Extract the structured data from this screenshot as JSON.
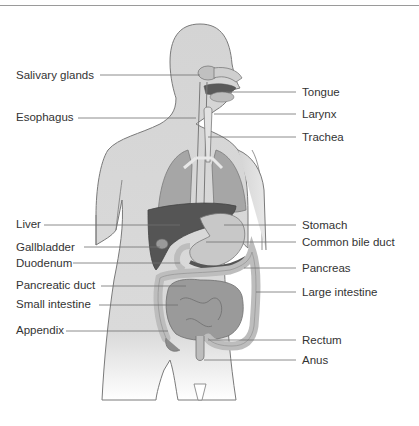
{
  "header": {
    "partial_text": "gest  y"
  },
  "diagram": {
    "labels_left": [
      {
        "id": "salivary-glands",
        "text": "Salivary glands",
        "x": 16,
        "y": 69
      },
      {
        "id": "esophagus",
        "text": "Esophagus",
        "x": 16,
        "y": 111
      },
      {
        "id": "liver",
        "text": "Liver",
        "x": 16,
        "y": 218
      },
      {
        "id": "gallbladder",
        "text": "Gallbladder",
        "x": 16,
        "y": 241
      },
      {
        "id": "duodenum",
        "text": "Duodenum",
        "x": 16,
        "y": 257
      },
      {
        "id": "pancreatic-duct",
        "text": "Pancreatic duct",
        "x": 16,
        "y": 279
      },
      {
        "id": "small-intestine",
        "text": "Small intestine",
        "x": 16,
        "y": 298
      },
      {
        "id": "appendix",
        "text": "Appendix",
        "x": 16,
        "y": 324
      }
    ],
    "labels_right": [
      {
        "id": "tongue",
        "text": "Tongue",
        "x": 302,
        "y": 87
      },
      {
        "id": "larynx",
        "text": "Larynx",
        "x": 302,
        "y": 108
      },
      {
        "id": "trachea",
        "text": "Trachea",
        "x": 302,
        "y": 131
      },
      {
        "id": "stomach",
        "text": "Stomach",
        "x": 302,
        "y": 219
      },
      {
        "id": "common-bile-duct",
        "text": "Common bile duct",
        "x": 302,
        "y": 236
      },
      {
        "id": "pancreas",
        "text": "Pancreas",
        "x": 302,
        "y": 262
      },
      {
        "id": "large-intestine",
        "text": "Large intestine",
        "x": 302,
        "y": 286
      },
      {
        "id": "rectum",
        "text": "Rectum",
        "x": 302,
        "y": 334
      },
      {
        "id": "anus",
        "text": "Anus",
        "x": 302,
        "y": 354
      }
    ]
  },
  "colors": {
    "body_fill": "#d4d4d4",
    "body_outline": "#7a7a7a",
    "lung": "#a6a6a6",
    "liver": "#555555",
    "stomach": "#c8c8c8",
    "small_intestine": "#9a9a9a",
    "large_intestine": "#bdbdbd",
    "leader_line": "#6e6e6e",
    "text": "#333333"
  }
}
